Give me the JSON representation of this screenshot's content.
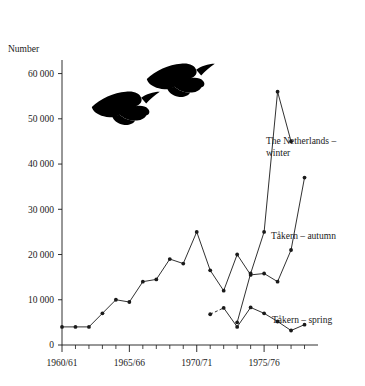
{
  "chart_data": {
    "type": "line",
    "title": "",
    "xlabel": "",
    "ylabel": "Number",
    "ylim": [
      0,
      63000
    ],
    "yticks": [
      0,
      10000,
      20000,
      30000,
      40000,
      50000,
      60000
    ],
    "ytick_labels": [
      "0",
      "10 000",
      "20 000",
      "30 000",
      "40 000",
      "50 000",
      "60 000"
    ],
    "xlim": [
      1960,
      1979
    ],
    "xticks_major": [
      1960,
      1965,
      1970,
      1975
    ],
    "xtick_labels": [
      "1960/61",
      "1965/66",
      "1970/71",
      "1975/76"
    ],
    "xticks_minor": [
      1961,
      1962,
      1963,
      1964,
      1966,
      1967,
      1968,
      1969,
      1971,
      1972,
      1973,
      1974,
      1976,
      1977,
      1978
    ],
    "grid": false,
    "legend_position": "inline-right-of-curves",
    "marker": "filled-circle",
    "line_color": "#1a1a1a",
    "series": [
      {
        "name": "Tåkern – autumn",
        "label": "Tåkern – autumn",
        "style": "solid",
        "x": [
          1960,
          1961,
          1962,
          1963,
          1964,
          1965,
          1966,
          1967,
          1968,
          1969,
          1970,
          1971,
          1972,
          1973,
          1974,
          1975,
          1976,
          1977,
          1978
        ],
        "values": [
          4000,
          4000,
          4000,
          7000,
          10000,
          9500,
          14000,
          14500,
          19000,
          18000,
          25000,
          16500,
          12000,
          20000,
          15500,
          15800,
          14000,
          21000,
          37000
        ]
      },
      {
        "name": "The Netherlands – winter",
        "label": "The Netherlands – winter",
        "style": "solid",
        "x": [
          1973,
          1974,
          1975,
          1976,
          1977
        ],
        "values": [
          5000,
          15800,
          25000,
          56000,
          45000
        ]
      },
      {
        "name": "Tåkern – spring",
        "label": "Tåkern – spring",
        "style": "solid-with-leading-dash",
        "x": [
          1971,
          1972,
          1973,
          1974,
          1975,
          1976,
          1977,
          1978
        ],
        "values": [
          6800,
          8200,
          4000,
          8300,
          7000,
          5200,
          3200,
          4500
        ]
      }
    ],
    "annotations": [
      {
        "name": "goose-silhouette-upper",
        "kind": "flying-goose"
      },
      {
        "name": "goose-silhouette-lower",
        "kind": "flying-goose"
      }
    ]
  }
}
